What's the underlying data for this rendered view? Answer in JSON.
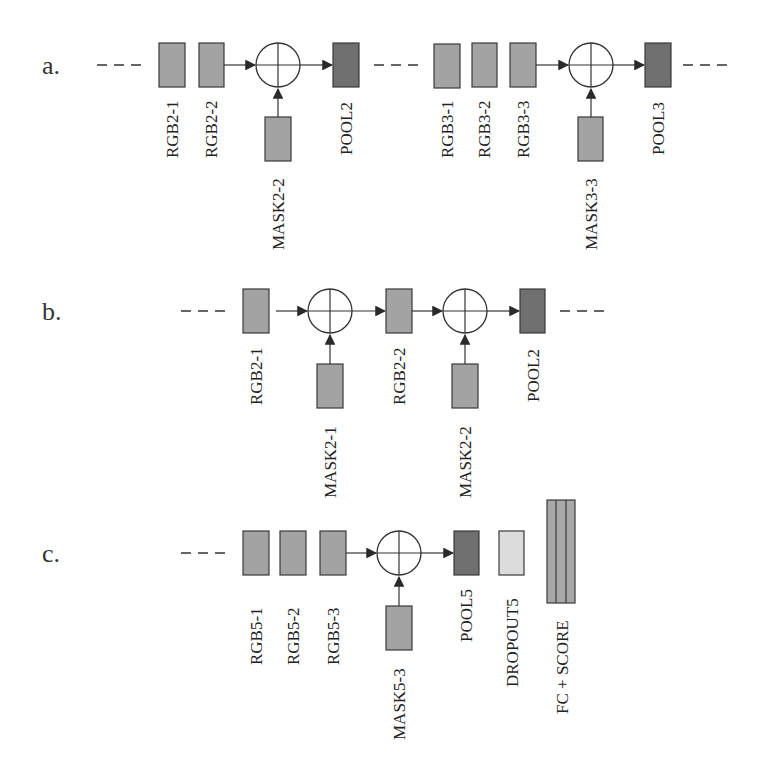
{
  "figure": {
    "colors": {
      "background": "#ffffff",
      "conv_block": "#a3a3a3",
      "pool_block": "#6f6f6f",
      "dropout_block": "#dcdcdc",
      "fc_block": "#a8a8a8",
      "stroke": "#3a3a3a"
    },
    "rows": [
      {
        "id": "a",
        "label": "a.",
        "nodes": [
          {
            "type": "dashes"
          },
          {
            "type": "conv",
            "label": "RGB2-1"
          },
          {
            "type": "conv",
            "label": "RGB2-2"
          },
          {
            "type": "sum",
            "mask": "MASK2-2"
          },
          {
            "type": "pool",
            "label": "POOL2"
          },
          {
            "type": "dashes"
          },
          {
            "type": "conv",
            "label": "RGB3-1"
          },
          {
            "type": "conv",
            "label": "RGB3-2"
          },
          {
            "type": "conv",
            "label": "RGB3-3"
          },
          {
            "type": "sum",
            "mask": "MASK3-3"
          },
          {
            "type": "pool",
            "label": "POOL3"
          },
          {
            "type": "dashes"
          }
        ]
      },
      {
        "id": "b",
        "label": "b.",
        "nodes": [
          {
            "type": "dashes"
          },
          {
            "type": "conv",
            "label": "RGB2-1"
          },
          {
            "type": "sum",
            "mask": "MASK2-1"
          },
          {
            "type": "conv",
            "label": "RGB2-2"
          },
          {
            "type": "sum",
            "mask": "MASK2-2"
          },
          {
            "type": "pool",
            "label": "POOL2"
          },
          {
            "type": "dashes"
          }
        ]
      },
      {
        "id": "c",
        "label": "c.",
        "nodes": [
          {
            "type": "dashes"
          },
          {
            "type": "conv",
            "label": "RGB5-1"
          },
          {
            "type": "conv",
            "label": "RGB5-2"
          },
          {
            "type": "conv",
            "label": "RGB5-3"
          },
          {
            "type": "sum",
            "mask": "MASK5-3"
          },
          {
            "type": "pool",
            "label": "POOL5"
          },
          {
            "type": "dropout",
            "label": "DROPOUT5"
          },
          {
            "type": "fc",
            "label": "FC + SCORE"
          }
        ]
      }
    ]
  },
  "labels": {
    "row_a": "a.",
    "row_b": "b.",
    "row_c": "c.",
    "a_rgb2_1": "RGB2-1",
    "a_rgb2_2": "RGB2-2",
    "a_mask2_2": "MASK2-2",
    "a_pool2": "POOL2",
    "a_rgb3_1": "RGB3-1",
    "a_rgb3_2": "RGB3-2",
    "a_rgb3_3": "RGB3-3",
    "a_mask3_3": "MASK3-3",
    "a_pool3": "POOL3",
    "b_rgb2_1": "RGB2-1",
    "b_mask2_1": "MASK2-1",
    "b_rgb2_2": "RGB2-2",
    "b_mask2_2": "MASK2-2",
    "b_pool2": "POOL2",
    "c_rgb5_1": "RGB5-1",
    "c_rgb5_2": "RGB5-2",
    "c_rgb5_3": "RGB5-3",
    "c_mask5_3": "MASK5-3",
    "c_pool5": "POOL5",
    "c_dropout5": "DROPOUT5",
    "c_fc_score": "FC + SCORE"
  }
}
